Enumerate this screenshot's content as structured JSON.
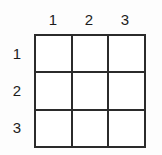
{
  "figure": {
    "type": "grid-table",
    "background_color": "#fdfdfd",
    "line_color": "#2b2b2b",
    "text_color": "#1c1c1c",
    "rows": 3,
    "columns": 3
  },
  "column_headers": [
    {
      "label": "1"
    },
    {
      "label": "2"
    },
    {
      "label": "3"
    }
  ],
  "row_headers": [
    {
      "label": "1"
    },
    {
      "label": "2"
    },
    {
      "label": "3"
    }
  ],
  "cells": [
    {
      "row": 1,
      "column": 1,
      "value": ""
    },
    {
      "row": 1,
      "column": 2,
      "value": ""
    },
    {
      "row": 1,
      "column": 3,
      "value": ""
    },
    {
      "row": 2,
      "column": 1,
      "value": ""
    },
    {
      "row": 2,
      "column": 2,
      "value": ""
    },
    {
      "row": 2,
      "column": 3,
      "value": ""
    },
    {
      "row": 3,
      "column": 1,
      "value": ""
    },
    {
      "row": 3,
      "column": 2,
      "value": ""
    },
    {
      "row": 3,
      "column": 3,
      "value": ""
    }
  ]
}
